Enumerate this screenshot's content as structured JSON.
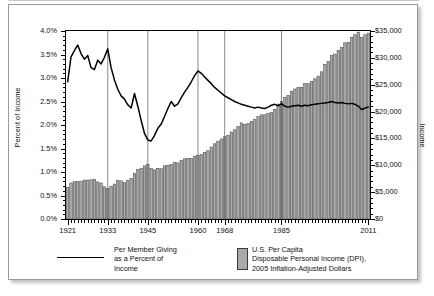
{
  "chart_data": {
    "type": "line",
    "title": "",
    "xlabel": "",
    "ylabel": "Percent of Income",
    "ylabel_right": "Income",
    "xlim": [
      1921,
      2011
    ],
    "ylim": [
      0.0,
      4.0
    ],
    "ylim_right": [
      0,
      35000
    ],
    "grid": "vertical-only",
    "gridlines_x": [
      1933,
      1945,
      1960,
      1968,
      1985
    ],
    "legend_position": "below-plot",
    "xticks": [
      "1921",
      "1933",
      "1945",
      "1960",
      "1968",
      "1985",
      "2011"
    ],
    "xtick_values": [
      1921,
      1933,
      1945,
      1960,
      1968,
      1985,
      2011
    ],
    "yticks_left": [
      "0.0%",
      "0.5%",
      "1.0%",
      "1.5%",
      "2.0%",
      "2.5%",
      "3.0%",
      "3.5%",
      "4.0%"
    ],
    "ytick_values_left": [
      0.0,
      0.5,
      1.0,
      1.5,
      2.0,
      2.5,
      3.0,
      3.5,
      4.0
    ],
    "yticks_right": [
      "$0",
      "$5,000",
      "$10,000",
      "$15,000",
      "$20,000",
      "$25,000",
      "$30,000",
      "$35,000"
    ],
    "ytick_values_right": [
      0,
      5000,
      10000,
      15000,
      20000,
      25000,
      30000,
      35000
    ],
    "colors": {
      "line": "#000000",
      "bar_fill": "#a9a9a9",
      "bar_edge": "#3a3a3a",
      "frame": "#000000",
      "gridline": "#555555",
      "panel_border": "#9a9a9a"
    },
    "x": [
      1921,
      1922,
      1923,
      1924,
      1925,
      1926,
      1927,
      1928,
      1929,
      1930,
      1931,
      1932,
      1933,
      1934,
      1935,
      1936,
      1937,
      1938,
      1939,
      1940,
      1941,
      1942,
      1943,
      1944,
      1945,
      1946,
      1947,
      1948,
      1949,
      1950,
      1951,
      1952,
      1953,
      1954,
      1955,
      1956,
      1957,
      1958,
      1959,
      1960,
      1961,
      1962,
      1963,
      1964,
      1965,
      1966,
      1967,
      1968,
      1969,
      1970,
      1971,
      1972,
      1973,
      1974,
      1975,
      1976,
      1977,
      1978,
      1979,
      1980,
      1981,
      1982,
      1983,
      1984,
      1985,
      1986,
      1987,
      1988,
      1989,
      1990,
      1991,
      1992,
      1993,
      1994,
      1995,
      1996,
      1997,
      1998,
      1999,
      2000,
      2001,
      2002,
      2003,
      2004,
      2005,
      2006,
      2007,
      2008,
      2009,
      2010,
      2011
    ],
    "series": [
      {
        "name": "Per Member Giving as a Percent of Income",
        "axis": "left",
        "units": "percent",
        "type": "line",
        "values": [
          2.92,
          3.45,
          3.58,
          3.7,
          3.52,
          3.4,
          3.48,
          3.22,
          3.18,
          3.38,
          3.3,
          3.44,
          3.62,
          3.22,
          2.96,
          2.76,
          2.62,
          2.55,
          2.43,
          2.36,
          2.67,
          2.4,
          2.1,
          1.82,
          1.68,
          1.66,
          1.78,
          1.93,
          2.02,
          2.18,
          2.35,
          2.5,
          2.4,
          2.45,
          2.58,
          2.7,
          2.8,
          2.92,
          3.05,
          3.15,
          3.1,
          3.02,
          2.95,
          2.88,
          2.8,
          2.74,
          2.68,
          2.62,
          2.58,
          2.54,
          2.5,
          2.47,
          2.44,
          2.42,
          2.4,
          2.38,
          2.36,
          2.38,
          2.36,
          2.35,
          2.38,
          2.42,
          2.44,
          2.41,
          2.45,
          2.4,
          2.38,
          2.4,
          2.41,
          2.42,
          2.4,
          2.42,
          2.41,
          2.43,
          2.44,
          2.45,
          2.46,
          2.47,
          2.48,
          2.5,
          2.48,
          2.47,
          2.48,
          2.46,
          2.45,
          2.46,
          2.44,
          2.4,
          2.33,
          2.36,
          2.38
        ]
      },
      {
        "name": "U.S. Per Capita Disposable Personal Income (DPI), 2005 Inflation-Adjusted Dollars",
        "axis": "right",
        "units": "dollars",
        "type": "bar",
        "values": [
          5900,
          6700,
          6950,
          6950,
          7050,
          7250,
          7250,
          7300,
          7400,
          6900,
          6700,
          6000,
          5700,
          6100,
          6500,
          7150,
          7100,
          6800,
          7200,
          7550,
          8500,
          9200,
          9400,
          9900,
          10200,
          9400,
          9150,
          9450,
          9350,
          9900,
          10000,
          10150,
          10500,
          10450,
          10900,
          11200,
          11300,
          11300,
          11600,
          11800,
          12000,
          12400,
          12700,
          13400,
          14000,
          14500,
          14900,
          15300,
          15600,
          16200,
          16600,
          17200,
          17900,
          17600,
          17800,
          18200,
          18500,
          19100,
          19400,
          19400,
          19700,
          19800,
          20400,
          21400,
          21900,
          22600,
          23000,
          23800,
          24200,
          24500,
          24500,
          25200,
          25200,
          25600,
          26100,
          26600,
          27400,
          28800,
          29300,
          30400,
          30700,
          31400,
          31900,
          32800,
          32900,
          33800,
          34300,
          34800,
          33800,
          34300,
          34600
        ]
      }
    ]
  },
  "legend": {
    "series1_label": "Per Member Giving\nas a Percent of\nIncome",
    "series2_label": "U.S. Per Capita\nDisposable Personal Income (DPI),\n2005 Inflation-Adjusted Dollars"
  }
}
